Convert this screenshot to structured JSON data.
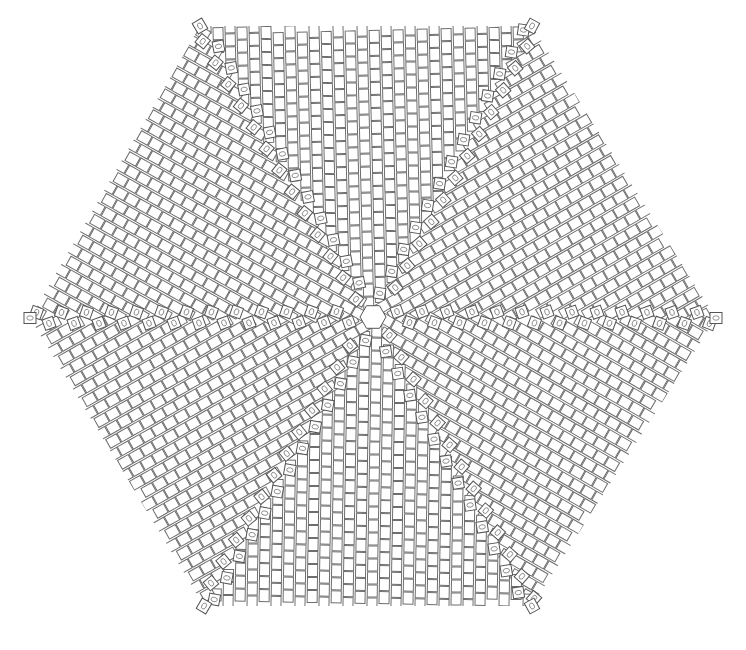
{
  "diagram": {
    "shape": "hexagon",
    "orientation": "flat-top",
    "center": [
      373,
      317
    ],
    "corners": {
      "top_left": [
        200,
        26
      ],
      "top_right": [
        532,
        26
      ],
      "right": [
        716,
        318
      ],
      "bottom_right": [
        532,
        606
      ],
      "bottom_left": [
        204,
        606
      ],
      "left": [
        30,
        318
      ]
    },
    "sectors": 6,
    "bead": {
      "width": 10,
      "height": 12,
      "column_pitch": 12,
      "row_pitch": 20
    },
    "increase_spokes": 6,
    "increase_bead_marker": "oval",
    "colors": {
      "background": "#ffffff",
      "bead_fill": "#ffffff",
      "bead_outline": "#6e6e6e",
      "increase_outline": "#555555"
    },
    "labels": []
  }
}
